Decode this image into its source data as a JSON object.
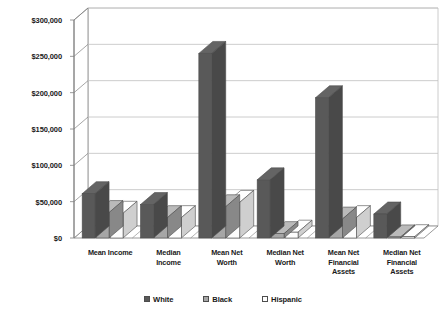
{
  "chart_data": {
    "type": "bar",
    "title": "",
    "subtitle": "",
    "xlabel": "",
    "ylabel": "",
    "categories": [
      "Mean Income",
      "Median Income",
      "Mean Net Worth",
      "Median Net Worth",
      "Mean Net Financial Assets",
      "Median Net Financial Assets"
    ],
    "category_label_lines": [
      [
        "Mean Income"
      ],
      [
        "Median",
        "Income"
      ],
      [
        "Mean Net",
        "Worth"
      ],
      [
        "Median Net",
        "Worth"
      ],
      [
        "Mean Net",
        "Financial",
        "Assets"
      ],
      [
        "Median Net",
        "Financial",
        "Assets"
      ]
    ],
    "series": [
      {
        "name": "White",
        "color": "#595959",
        "values": [
          61000,
          46000,
          254000,
          80000,
          193000,
          33000
        ]
      },
      {
        "name": "Black",
        "color": "#a6a6a6",
        "values": [
          35000,
          28000,
          43000,
          6000,
          26000,
          1500
        ]
      },
      {
        "name": "Hispanic",
        "color": "#fdfdfd",
        "values": [
          34000,
          28000,
          49000,
          8000,
          28000,
          1800
        ]
      }
    ],
    "ylim": [
      0,
      300000
    ],
    "ytick_step": 50000,
    "ytick_labels": [
      "$0",
      "$50,000",
      "$100,000",
      "$150,000",
      "$200,000",
      "$250,000",
      "$300,000"
    ],
    "ytick_values": [
      0,
      50000,
      100000,
      150000,
      200000,
      250000,
      300000
    ],
    "grid": true,
    "grid_axis": "y",
    "legend_position": "bottom",
    "style": "3d-column",
    "plot_background": "#ffffff",
    "grid_color": "#bfbfbf",
    "axis_color": "#808080",
    "bar_outline_color": "#4d4d4d"
  }
}
